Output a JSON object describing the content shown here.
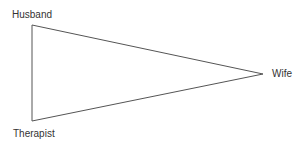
{
  "diagram": {
    "type": "triangle",
    "nodes": [
      {
        "id": "husband",
        "label": "Husband",
        "x": 32,
        "y": 25
      },
      {
        "id": "wife",
        "label": "Wife",
        "x": 263,
        "y": 74
      },
      {
        "id": "therapist",
        "label": "Therapist",
        "x": 32,
        "y": 121
      }
    ],
    "edges": [
      {
        "from": "husband",
        "to": "wife"
      },
      {
        "from": "wife",
        "to": "therapist"
      },
      {
        "from": "therapist",
        "to": "husband"
      }
    ],
    "line_color": "#555555"
  }
}
